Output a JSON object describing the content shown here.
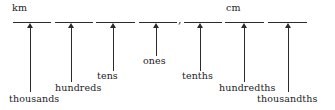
{
  "diagram": {
    "type": "place-value-chart",
    "unit_markers": [
      {
        "label": "km",
        "x": 12,
        "y": 2,
        "over_column": 0
      },
      {
        "label": "cm",
        "x": 226,
        "y": 2,
        "over_column": 5
      }
    ],
    "decimal_separator": {
      "glyph": ",",
      "x": 178,
      "y": 14
    },
    "columns": [
      {
        "label": "thousands",
        "line_x": 13,
        "line_width": 38,
        "arrow_x": 30,
        "line_y": 22,
        "stem_bottom": 92,
        "label_x": 9,
        "label_y": 93
      },
      {
        "label": "hundreds",
        "line_x": 55,
        "line_width": 38,
        "arrow_x": 71,
        "line_y": 22,
        "stem_bottom": 82,
        "label_x": 55,
        "label_y": 82
      },
      {
        "label": "tens",
        "line_x": 96,
        "line_width": 39,
        "arrow_x": 113,
        "line_y": 22,
        "stem_bottom": 71,
        "label_x": 97,
        "label_y": 70
      },
      {
        "label": "ones",
        "line_x": 139,
        "line_width": 38,
        "arrow_x": 156,
        "line_y": 22,
        "stem_bottom": 56,
        "label_x": 143,
        "label_y": 55
      },
      {
        "label": "tenths",
        "line_x": 184,
        "line_width": 38,
        "arrow_x": 200,
        "line_y": 22,
        "stem_bottom": 71,
        "label_x": 182,
        "label_y": 70
      },
      {
        "label": "hundredths",
        "line_x": 225,
        "line_width": 39,
        "arrow_x": 244,
        "line_y": 22,
        "stem_bottom": 82,
        "label_x": 219,
        "label_y": 82
      },
      {
        "label": "thousandths",
        "line_x": 268,
        "line_width": 39,
        "arrow_x": 288,
        "line_y": 22,
        "stem_bottom": 92,
        "label_x": 257,
        "label_y": 93
      }
    ],
    "colors": {
      "ink": "#2b2b2b",
      "text": "#1d1d1d",
      "background": "#ffffff"
    }
  }
}
